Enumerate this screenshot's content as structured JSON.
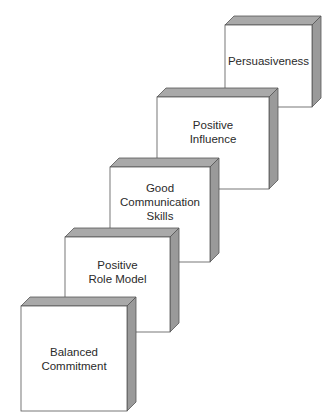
{
  "diagram": {
    "type": "staircase-3d-boxes",
    "colors": {
      "face": "#ffffff",
      "edge": "#555555",
      "top": "#a9a9a9",
      "side": "#9a9a9a",
      "background": "#ffffff"
    },
    "depth": 9,
    "boxes": [
      {
        "id": "persuasiveness",
        "lines": [
          "Persuasiveness"
        ],
        "x": 225,
        "y": 25,
        "w": 87,
        "h": 82
      },
      {
        "id": "positive-influence",
        "lines": [
          "Positive",
          "Influence"
        ],
        "x": 157,
        "y": 97,
        "w": 112,
        "h": 92
      },
      {
        "id": "good-communication-skills",
        "lines": [
          "Good",
          "Communication",
          "Skills"
        ],
        "x": 110,
        "y": 167,
        "w": 100,
        "h": 95
      },
      {
        "id": "positive-role-model",
        "lines": [
          "Positive",
          "Role Model"
        ],
        "x": 65,
        "y": 237,
        "w": 105,
        "h": 95
      },
      {
        "id": "balanced-commitment",
        "lines": [
          "Balanced",
          "Commitment"
        ],
        "x": 21,
        "y": 306,
        "w": 106,
        "h": 105
      }
    ]
  }
}
